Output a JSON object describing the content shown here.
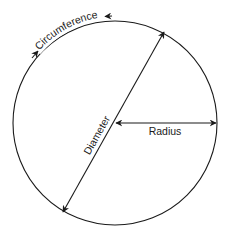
{
  "diagram": {
    "labels": {
      "circumference": "Circumference",
      "diameter": "Diameter",
      "radius": "Radius"
    },
    "colors": {
      "stroke": "#1a1a1a",
      "background": "#ffffff"
    },
    "geometry": {
      "center": [
        115,
        123
      ],
      "radius": 102
    }
  }
}
